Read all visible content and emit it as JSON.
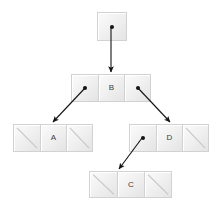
{
  "diagram": {
    "type": "binary-tree",
    "canvas": {
      "width": 219,
      "height": 209
    },
    "colors": {
      "background": "#ffffff",
      "cell_light": "#fbfbfb",
      "cell_mid": "#f1f1f1",
      "cell_dark": "#e4e4e4",
      "cell_border": "#d2d2d2",
      "ink": "#141414",
      "label_text": "#3b3b3b",
      "null_slash": "#c9c9c9"
    },
    "nodes": [
      {
        "id": "root",
        "label": "",
        "kind": "root-pointer",
        "cells": [
          {
            "type": "pointer",
            "value": "●",
            "target": "B"
          }
        ]
      },
      {
        "id": "node-b",
        "label": "B",
        "kind": "internal",
        "cells": [
          {
            "type": "pointer",
            "value": "●",
            "target": "A"
          },
          {
            "type": "data",
            "value": "B"
          },
          {
            "type": "pointer",
            "value": "●",
            "target": "D"
          }
        ]
      },
      {
        "id": "node-a",
        "label": "A",
        "kind": "leaf",
        "cells": [
          {
            "type": "null",
            "value": "",
            "target": null
          },
          {
            "type": "data",
            "value": "A"
          },
          {
            "type": "null",
            "value": "",
            "target": null
          }
        ]
      },
      {
        "id": "node-d",
        "label": "D",
        "kind": "internal",
        "cells": [
          {
            "type": "pointer",
            "value": "●",
            "target": "C"
          },
          {
            "type": "data",
            "value": "D"
          },
          {
            "type": "null",
            "value": "",
            "target": null
          }
        ]
      },
      {
        "id": "node-c",
        "label": "C",
        "kind": "leaf",
        "cells": [
          {
            "type": "null",
            "value": "",
            "target": null
          },
          {
            "type": "data",
            "value": "C"
          },
          {
            "type": "null",
            "value": "",
            "target": null
          }
        ]
      }
    ],
    "edges": [
      {
        "id": "edge-root-b",
        "from": "root",
        "to": "B",
        "x1": 111,
        "y1": 27,
        "x2": 111,
        "y2": 72
      },
      {
        "id": "edge-b-a",
        "from": "B",
        "to": "A",
        "x1": 85,
        "y1": 88,
        "x2": 53,
        "y2": 122
      },
      {
        "id": "edge-b-d",
        "from": "B",
        "to": "D",
        "x1": 138,
        "y1": 88,
        "x2": 170,
        "y2": 122
      },
      {
        "id": "edge-d-c",
        "from": "D",
        "to": "C",
        "x1": 142,
        "y1": 138,
        "x2": 119,
        "y2": 169
      }
    ]
  }
}
